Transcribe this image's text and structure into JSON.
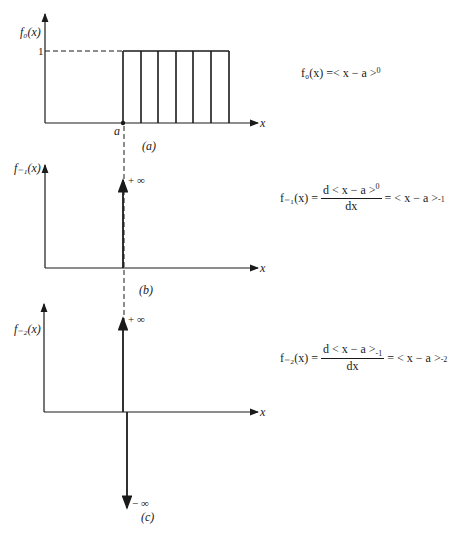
{
  "panels": {
    "a": {
      "ylabel": "f₀(x)",
      "xlabel": "x",
      "level_label": "1",
      "a_label": "a",
      "caption": "(a)",
      "equation": {
        "lhs": "f₀(x) = ",
        "rhs": "< x − a >",
        "sup": "0"
      }
    },
    "b": {
      "ylabel": "f₋₁(x)",
      "xlabel": "x",
      "impulse_label": "+ ∞",
      "caption": "(b)",
      "equation": {
        "lhs": "f₋₁(x) = ",
        "num": "d < x − a >",
        "num_sup": "0",
        "den": "dx",
        "rhs": " = < x − a >",
        "rhs_sub": "-1"
      }
    },
    "c": {
      "ylabel": "f₋₂(x)",
      "xlabel": "x",
      "impulse_up_label": "+ ∞",
      "impulse_down_label": "− ∞",
      "caption": "(c)",
      "equation": {
        "lhs": "f₋₂(x) = ",
        "num": "d < x − a >",
        "num_sub": "-1",
        "den": "dx",
        "rhs": " = < x − a >",
        "rhs_sub": "-2"
      }
    }
  }
}
